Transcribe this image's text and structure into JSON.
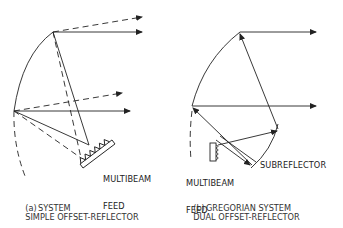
{
  "panel_a": {
    "feed_label_line1": "MULTIBEAM",
    "feed_label_line2": "FEED",
    "caption_prefix": "(a)",
    "caption_line1": "SIMPLE OFFSET-REFLECTOR",
    "caption_line2": "SYSTEM"
  },
  "panel_b": {
    "feed_label_line1": "MULTIBEAM",
    "feed_label_line2": "FEED",
    "subreflector_label": "SUBREFLECTOR",
    "caption_prefix": "(b)",
    "caption_line1": "DUAL OFFSET-REFLECTOR",
    "caption_line2": "GREGORIAN SYSTEM"
  },
  "colors": {
    "line": "#222222",
    "background": "#ffffff"
  }
}
